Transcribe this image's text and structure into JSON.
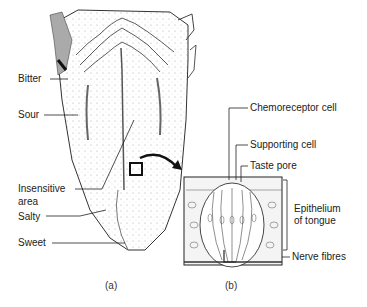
{
  "figure": {
    "part_a": {
      "caption": "(a)",
      "labels": {
        "bitter": "Bitter",
        "sour": "Sour",
        "insensitive_line1": "Insensitive",
        "insensitive_line2": "area",
        "salty": "Salty",
        "sweet": "Sweet"
      }
    },
    "part_b": {
      "caption": "(b)",
      "labels": {
        "chemoreceptor": "Chemoreceptor cell",
        "supporting": "Supporting cell",
        "taste_pore": "Taste pore",
        "epithelium_line1": "Epithelium",
        "epithelium_line2": "of tongue",
        "nerve": "Nerve fibres"
      }
    }
  }
}
